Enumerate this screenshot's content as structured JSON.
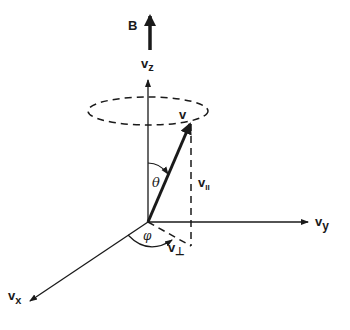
{
  "diagram": {
    "type": "vector-decomposition",
    "field": {
      "label": "B"
    },
    "axes": {
      "z": {
        "base": "v",
        "subscript": "z"
      },
      "y": {
        "base": "v",
        "subscript": "y"
      },
      "x": {
        "base": "v",
        "subscript": "x"
      }
    },
    "vector": {
      "label": "v"
    },
    "components": {
      "parallel": {
        "base": "v",
        "subscript": "II"
      },
      "perpendicular": {
        "base": "v",
        "subscript": "⊥"
      }
    },
    "angles": {
      "polar": "θ",
      "azimuthal": "φ"
    },
    "colors": {
      "ink": "#1a1a1a",
      "background": "#ffffff"
    }
  }
}
